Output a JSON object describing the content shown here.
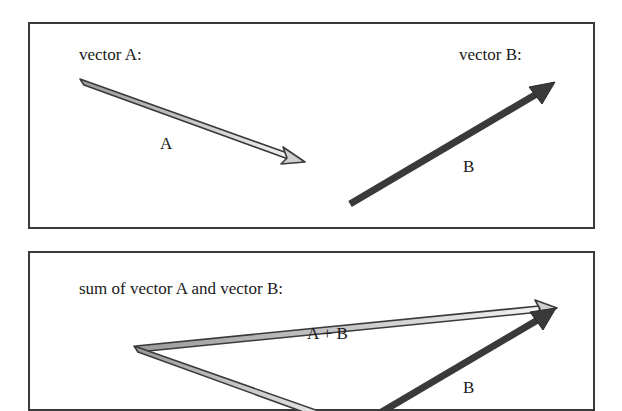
{
  "panels": [
    {
      "id": "individual-vectors",
      "labels": {
        "vector_a_title": "vector A:",
        "vector_b_title": "vector B:",
        "vector_a_tag": "A",
        "vector_b_tag": "B"
      }
    },
    {
      "id": "vector-sum",
      "labels": {
        "title": "sum of vector A and vector B:",
        "sum_tag": "A + B",
        "vector_b_tag": "B"
      }
    }
  ],
  "vectors": {
    "A": {
      "style": "hollow-light",
      "fill": "#d9d9d9",
      "stroke": "#3a3a3a",
      "from": [
        82,
        82
      ],
      "to": [
        305,
        162
      ]
    },
    "B": {
      "style": "solid-dark",
      "fill": "#3a3a3a",
      "stroke": "#2a2a2a",
      "from": [
        350,
        204
      ],
      "to": [
        555,
        82
      ]
    },
    "sum_A": {
      "from": [
        136,
        348
      ],
      "to": [
        359,
        428
      ]
    },
    "sum_B": {
      "from": [
        351,
        430
      ],
      "to": [
        556,
        308
      ]
    },
    "sum_AB": {
      "from": [
        136,
        348
      ],
      "to": [
        556,
        308
      ]
    }
  },
  "colors": {
    "border": "#3a3a3a",
    "light_arrow_fill": "#d9d9d9",
    "dark_arrow_fill": "#3a3a3a",
    "background": "#ffffff"
  }
}
